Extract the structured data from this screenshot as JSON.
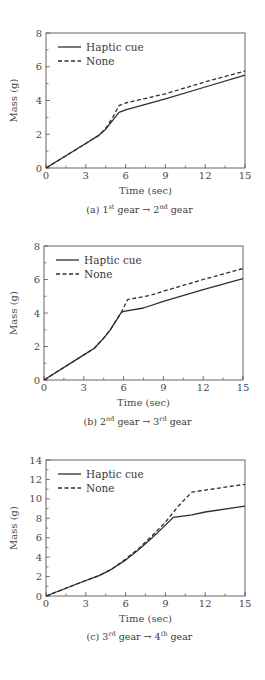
{
  "chart_data": [
    {
      "type": "line",
      "panel": "a",
      "caption": {
        "prefix": "(a) 1",
        "sup1": "st",
        "mid": " gear → 2",
        "sup2": "nd",
        "suffix": " gear"
      },
      "xlabel": "Time (sec)",
      "ylabel": "Mass (g)",
      "xlim": [
        0,
        15
      ],
      "ylim": [
        0,
        8
      ],
      "xticks": [
        0,
        3,
        6,
        9,
        12,
        15
      ],
      "yticks": [
        0,
        2,
        4,
        6,
        8
      ],
      "grid": false,
      "legend": "top-left",
      "series": [
        {
          "name": "Haptic cue",
          "style": "solid",
          "x": [
            0,
            3,
            4,
            4.5,
            5,
            5.5,
            6,
            9,
            12,
            15
          ],
          "y": [
            0,
            1.45,
            1.95,
            2.3,
            2.8,
            3.3,
            3.45,
            4.1,
            4.8,
            5.5
          ]
        },
        {
          "name": "None",
          "style": "dashed",
          "x": [
            0,
            3,
            4,
            4.5,
            5,
            5.5,
            6,
            9,
            12,
            15
          ],
          "y": [
            0,
            1.45,
            1.95,
            2.35,
            2.95,
            3.7,
            3.85,
            4.4,
            5.1,
            5.75
          ]
        }
      ]
    },
    {
      "type": "line",
      "panel": "b",
      "caption": {
        "prefix": "(b) 2",
        "sup1": "nd",
        "mid": " gear → 3",
        "sup2": "rd",
        "suffix": " gear"
      },
      "xlabel": "Time (sec)",
      "ylabel": "Mass (g)",
      "xlim": [
        0,
        15
      ],
      "ylim": [
        0,
        8
      ],
      "xticks": [
        0,
        3,
        6,
        9,
        12,
        15
      ],
      "yticks": [
        0,
        2,
        4,
        6,
        8
      ],
      "grid": false,
      "legend": "top-left",
      "series": [
        {
          "name": "Haptic cue",
          "style": "solid",
          "x": [
            0,
            3,
            3.8,
            4.5,
            5,
            5.8,
            6,
            7.5,
            9,
            12,
            15
          ],
          "y": [
            0,
            1.5,
            1.9,
            2.5,
            3.0,
            4.0,
            4.1,
            4.3,
            4.7,
            5.4,
            6.05
          ]
        },
        {
          "name": "None",
          "style": "dashed",
          "x": [
            0,
            3,
            3.8,
            4.5,
            5,
            5.8,
            6.3,
            8,
            9,
            12,
            15
          ],
          "y": [
            0,
            1.5,
            1.9,
            2.5,
            3.0,
            4.0,
            4.8,
            5.05,
            5.3,
            6.0,
            6.65
          ]
        }
      ]
    },
    {
      "type": "line",
      "panel": "c",
      "caption": {
        "prefix": "(c) 3",
        "sup1": "rd",
        "mid": " gear → 4",
        "sup2": "th",
        "suffix": " gear"
      },
      "xlabel": "Time (sec)",
      "ylabel": "Mass (g)",
      "xlim": [
        0,
        15
      ],
      "ylim": [
        0,
        14
      ],
      "xticks": [
        0,
        3,
        6,
        9,
        12,
        15
      ],
      "yticks": [
        0,
        2,
        4,
        6,
        8,
        10,
        12,
        14
      ],
      "grid": false,
      "legend": "top-left",
      "series": [
        {
          "name": "Haptic cue",
          "style": "solid",
          "x": [
            0,
            3,
            4,
            5,
            6,
            7,
            8,
            9,
            9.6,
            11,
            12,
            15
          ],
          "y": [
            0,
            1.6,
            2.1,
            2.8,
            3.7,
            4.8,
            6.0,
            7.3,
            8.1,
            8.35,
            8.65,
            9.25
          ]
        },
        {
          "name": "None",
          "style": "dashed",
          "x": [
            0,
            3,
            4,
            5,
            6,
            7,
            8,
            9,
            10,
            11,
            12,
            15
          ],
          "y": [
            0,
            1.6,
            2.1,
            2.8,
            3.8,
            4.9,
            6.2,
            7.6,
            9.3,
            10.7,
            10.9,
            11.5
          ]
        }
      ]
    }
  ]
}
